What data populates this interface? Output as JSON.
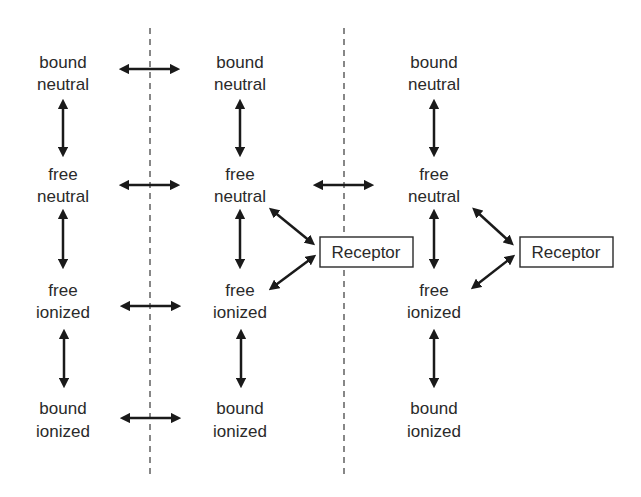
{
  "diagram": {
    "columns": [
      {
        "nodes": [
          {
            "line1": "bound",
            "line2": "neutral"
          },
          {
            "line1": "free",
            "line2": "neutral"
          },
          {
            "line1": "free",
            "line2": "ionized"
          },
          {
            "line1": "bound",
            "line2": "ionized"
          }
        ]
      },
      {
        "nodes": [
          {
            "line1": "bound",
            "line2": "neutral"
          },
          {
            "line1": "free",
            "line2": "neutral"
          },
          {
            "line1": "free",
            "line2": "ionized"
          },
          {
            "line1": "bound",
            "line2": "ionized"
          }
        ]
      },
      {
        "nodes": [
          {
            "line1": "bound",
            "line2": "neutral"
          },
          {
            "line1": "free",
            "line2": "neutral"
          },
          {
            "line1": "free",
            "line2": "ionized"
          },
          {
            "line1": "bound",
            "line2": "ionized"
          }
        ]
      }
    ],
    "receptors": [
      {
        "label": "Receptor"
      },
      {
        "label": "Receptor"
      }
    ],
    "colors": {
      "ink": "#1a1a1a",
      "text": "#2a2a2a",
      "dash": "#555555"
    }
  }
}
